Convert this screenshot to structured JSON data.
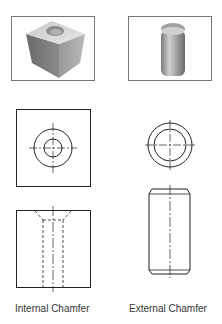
{
  "figure": {
    "columns": [
      {
        "id": "internal",
        "label": "Internal Chamfer",
        "photo": "cube-with-chamfered-hole-render",
        "views": [
          "top-view-square-concentric-circles",
          "front-view-square-hidden-hole-with-chamfer"
        ]
      },
      {
        "id": "external",
        "label": "External Chamfer",
        "photo": "cylinder-with-chamfered-ends-render",
        "views": [
          "top-view-concentric-circles",
          "front-view-rectangle-chamfered-corners"
        ]
      }
    ]
  },
  "colors": {
    "line": "#222222",
    "frame": "#777777",
    "text": "#333333"
  }
}
